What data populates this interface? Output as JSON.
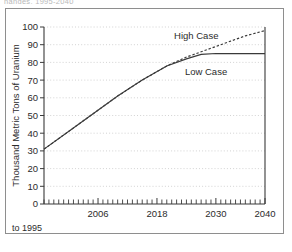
{
  "caption": {
    "clipped_top_text": "hanges, 1995-2040"
  },
  "footnote": {
    "text": "to 1995"
  },
  "chart_data": {
    "type": "line",
    "title": "",
    "xlabel": "",
    "ylabel": "Thousand Metric Tons of Uranium",
    "xlim": [
      1995,
      2040
    ],
    "ylim": [
      0,
      100
    ],
    "grid": true,
    "grid_style": "dotted-horizontal",
    "legend_position": "inline-annotation",
    "y_ticks": [
      0,
      10,
      20,
      30,
      40,
      50,
      60,
      70,
      80,
      90,
      100
    ],
    "y_tick_labels": [
      "0",
      "10",
      "20",
      "30",
      "40",
      "50",
      "60",
      "70",
      "80",
      "90",
      "100"
    ],
    "x_ticks_labeled": [
      2006,
      2018,
      2030,
      2040
    ],
    "x_tick_labels": [
      "2006",
      "2018",
      "2030",
      "2040"
    ],
    "x_minor_tick_interval": 1,
    "series": [
      {
        "name": "High Case",
        "style": "dashed",
        "color": "#3a3a3a",
        "label_x": 2026,
        "label_y": 93,
        "x": [
          1995,
          2000,
          2005,
          2010,
          2015,
          2020,
          2024,
          2027,
          2030,
          2033,
          2036,
          2040
        ],
        "values": [
          31,
          41,
          51,
          61,
          70,
          78,
          83,
          86,
          89,
          92,
          95,
          98
        ]
      },
      {
        "name": "Low Case",
        "style": "solid",
        "color": "#3a3a3a",
        "label_x": 2028,
        "label_y": 73,
        "x": [
          1995,
          2000,
          2005,
          2010,
          2015,
          2020,
          2024,
          2027,
          2030,
          2034,
          2040
        ],
        "values": [
          31,
          41,
          51,
          61,
          70,
          78,
          82,
          84.5,
          85,
          85,
          85
        ]
      }
    ]
  }
}
